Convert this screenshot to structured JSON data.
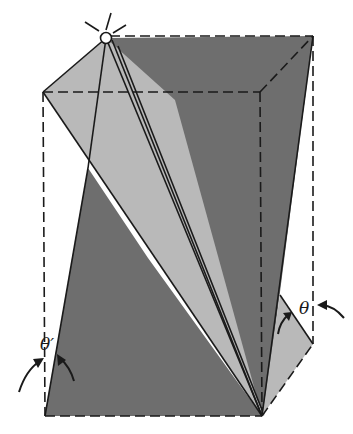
{
  "figure": {
    "labels": {
      "theta": "θ",
      "theta_prime": "θ′"
    },
    "colors": {
      "dark_plane": "#6e6e6e",
      "light_plane": "#b9b9b9",
      "outline": "#1a1a1a",
      "background": "#ffffff"
    }
  }
}
